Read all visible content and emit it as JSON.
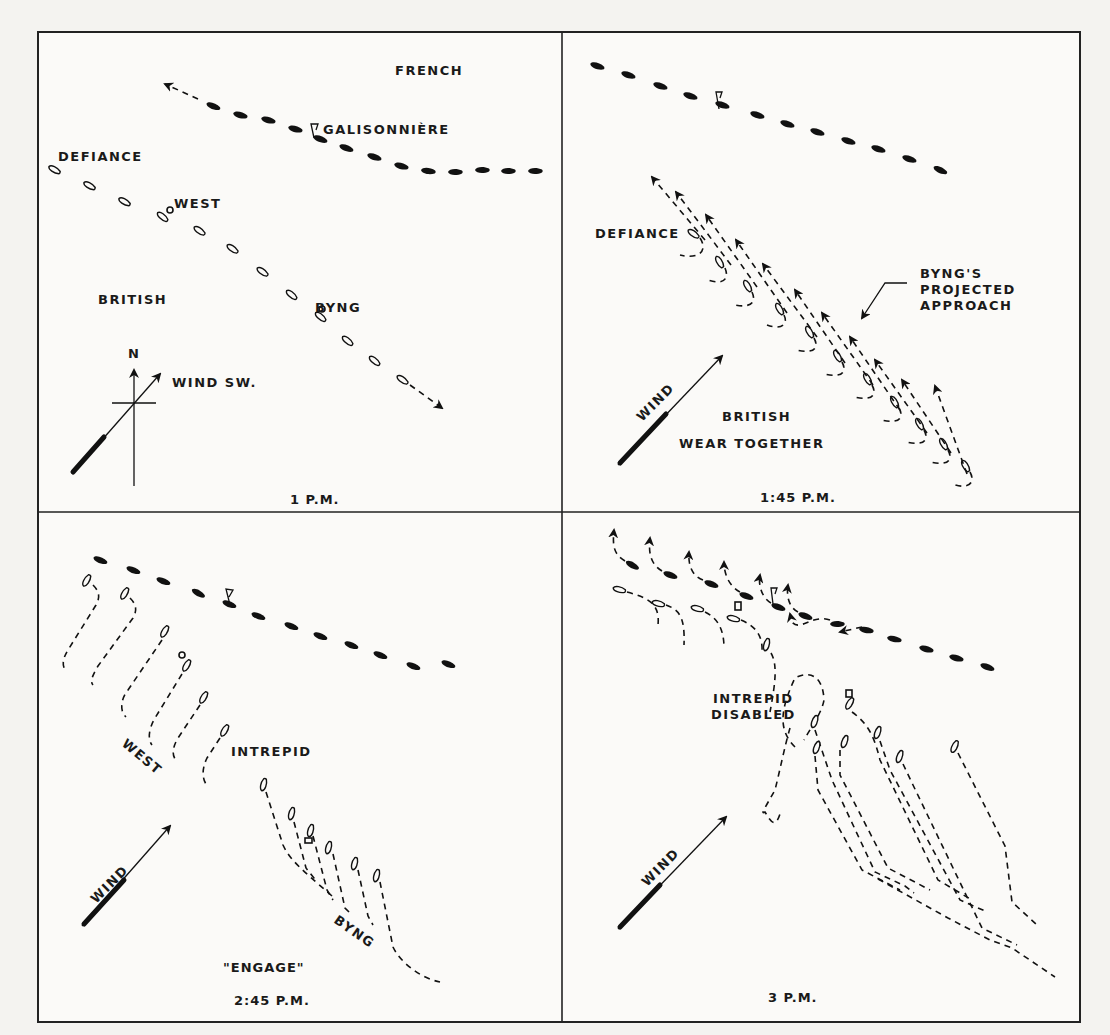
{
  "figure": {
    "panels": [
      {
        "id": "p1",
        "caption": "1 P.M.",
        "labels": {
          "french": "FRENCH",
          "flagship": "GALISONNIÈRE",
          "defiance": "DEFIANCE",
          "west": "WEST",
          "british": "BRITISH",
          "byng": "BYNG",
          "north": "N",
          "wind": "WIND SW."
        }
      },
      {
        "id": "p2",
        "caption": "1:45 P.M.",
        "labels": {
          "defiance": "DEFIANCE",
          "projected_line1": "BYNG'S",
          "projected_line2": "PROJECTED",
          "projected_line3": "APPROACH",
          "wind": "WIND",
          "british": "BRITISH",
          "maneuver": "WEAR TOGETHER"
        }
      },
      {
        "id": "p3",
        "caption": "2:45 P.M.",
        "labels": {
          "intrepid": "INTREPID",
          "west": "WEST",
          "wind": "WIND",
          "byng": "BYNG",
          "signal": "\"ENGAGE\""
        }
      },
      {
        "id": "p4",
        "caption": "3 P.M.",
        "labels": {
          "intrepid_line1": "INTREPID",
          "intrepid_line2": "DISABLED",
          "wind": "WIND"
        }
      }
    ],
    "legend_symbols": {
      "french_ship": "filled-hull",
      "british_ship": "outline-hull",
      "course": "dashed-line",
      "flagship": "flag-marker"
    }
  }
}
